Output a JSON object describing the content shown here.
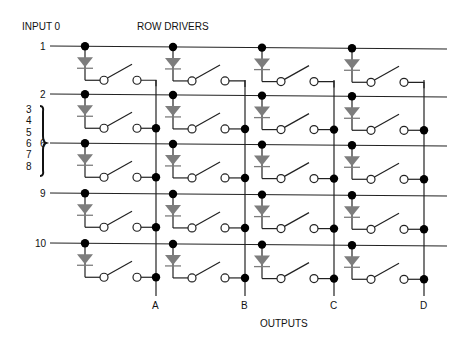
{
  "header": {
    "input_label": "INPUT 0",
    "row_drivers_label": "ROW DRIVERS"
  },
  "footer": {
    "outputs_label": "OUTPUTS"
  },
  "rows": [
    {
      "label": "1",
      "y": 46
    },
    {
      "label": "2",
      "y": 94
    },
    {
      "label": "6",
      "y": 143
    },
    {
      "label": "9",
      "y": 193
    },
    {
      "label": "10",
      "y": 243
    }
  ],
  "brace_labels": [
    "3",
    "4",
    "5",
    "6",
    "7",
    "8"
  ],
  "columns": [
    {
      "node_x": 85
    },
    {
      "node_x": 173
    },
    {
      "node_x": 262
    },
    {
      "node_x": 352
    }
  ],
  "outputs": [
    {
      "label": "A",
      "x": 156
    },
    {
      "label": "B",
      "x": 245
    },
    {
      "label": "C",
      "x": 334
    },
    {
      "label": "D",
      "x": 424
    }
  ],
  "colors": {
    "wire": "#222222",
    "diode": "#7d7d7d",
    "node": "#000000",
    "background": "#ffffff"
  }
}
